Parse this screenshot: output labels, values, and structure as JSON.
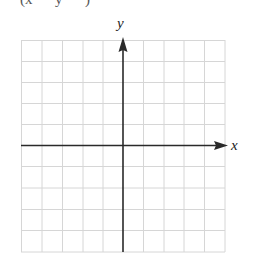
{
  "header": {
    "partial_text": "(x   y   )"
  },
  "graph": {
    "x_label": "x",
    "y_label": "y",
    "grid": {
      "columns": 10,
      "rows": 10
    },
    "colors": {
      "grid": "#d6d6d6",
      "axis": "#2a2a2a"
    }
  }
}
